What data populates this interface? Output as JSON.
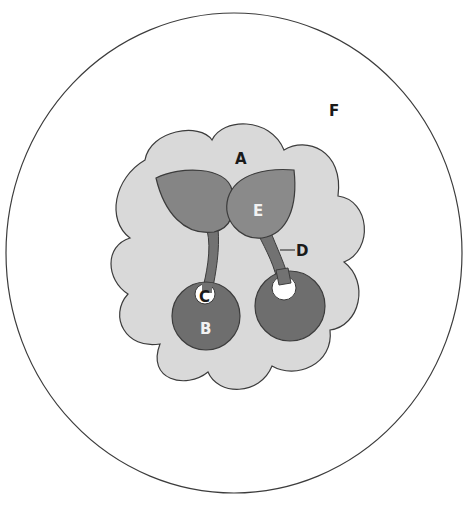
{
  "figure": {
    "type": "labeled-diagram",
    "regions": {
      "A": {
        "label": "A",
        "shape": "cloud",
        "fill": "#d9d9d9"
      },
      "B": {
        "label": "B",
        "shape": "left-cherry",
        "fill": "#6e6e6e"
      },
      "C": {
        "label": "C",
        "shape": "left-cherry-hole",
        "fill": "#ffffff"
      },
      "D": {
        "label": "D",
        "shape": "right-stem",
        "fill": "#727272"
      },
      "E": {
        "label": "E",
        "shape": "right-leaf",
        "fill": "#8a8a8a"
      },
      "F": {
        "label": "F",
        "shape": "outer-ellipse",
        "fill": "#ffffff"
      }
    },
    "unlabeled_parts": {
      "left_leaf_fill": "#858585",
      "right_cherry_fill": "#6e6e6e",
      "left_stem_fill": "#727272",
      "right_cherry_hole_fill": "#ffffff"
    },
    "colors": {
      "outline": "#3c3c3c",
      "background": "#ffffff",
      "label_dark": "#1a1a1a",
      "label_light": "#f2f2f2"
    }
  }
}
